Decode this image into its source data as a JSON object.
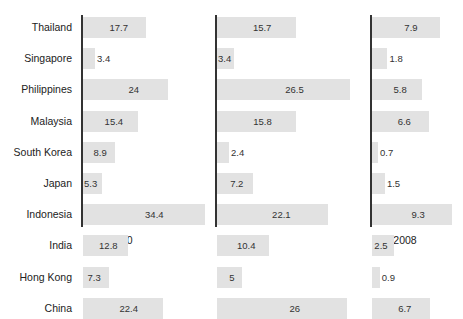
{
  "chart_data": {
    "type": "bar",
    "orientation": "horizontal",
    "title": "",
    "xlabel": "",
    "ylabel": "",
    "grid": false,
    "legend": null,
    "categories": [
      "Thailand",
      "Singapore",
      "Philippines",
      "Malaysia",
      "South Korea",
      "Japan",
      "Indonesia",
      "India",
      "Hong Kong",
      "China"
    ],
    "series": [
      {
        "name": "2000",
        "values": [
          17.7,
          3.4,
          24,
          15.4,
          8.9,
          5.3,
          34.4,
          12.8,
          7.3,
          22.4
        ],
        "labels": [
          "17.7",
          "3.4",
          "24",
          "15.4",
          "8.9",
          "5.3",
          "34.4",
          "12.8",
          "7.3",
          "22.4"
        ]
      },
      {
        "name": "2004",
        "values": [
          15.7,
          3.4,
          26.5,
          15.8,
          2.4,
          7.2,
          22.1,
          10.4,
          5,
          26
        ],
        "labels": [
          "15.7",
          "3.4",
          "26.5",
          "15.8",
          "2.4",
          "7.2",
          "22.1",
          "10.4",
          "5",
          "26"
        ]
      },
      {
        "name": "2008",
        "values": [
          7.9,
          1.8,
          5.8,
          6.6,
          0.7,
          1.5,
          9.3,
          2.5,
          0.9,
          6.7
        ],
        "labels": [
          "7.9",
          "1.8",
          "5.8",
          "6.6",
          "0.7",
          "1.5",
          "9.3",
          "2.5",
          "0.9",
          "6.7"
        ]
      }
    ],
    "bar_color": "#e2e2e2",
    "axis_color": "#333333"
  }
}
